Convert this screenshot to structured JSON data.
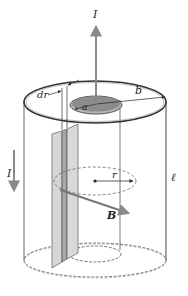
{
  "figure": {
    "labels": {
      "current_up": "I",
      "current_down": "I",
      "dr": "dr",
      "a": "a",
      "b": "b",
      "r": "r",
      "B": "B",
      "length": "ℓ"
    },
    "colors": {
      "line": "#333333",
      "arrow_gray": "#8a8a8a",
      "inner_top": "#8c8c8c",
      "inner_top_rim": "#b5b5b5",
      "strip_light": "#d6d6d6",
      "strip_dark": "#a8a8a8",
      "background": "#ffffff"
    }
  }
}
